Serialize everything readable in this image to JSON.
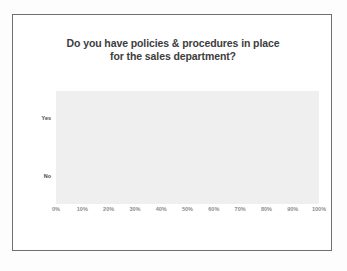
{
  "slide": {
    "title_line_1": "Do you have policies & procedures in place",
    "title_line_2": "for the sales department?",
    "border_color": "#6f6f6f",
    "background_color": "#ffffff"
  },
  "chart_data": {
    "type": "bar",
    "orientation": "horizontal",
    "title": "Do you have policies & procedures in place for the sales department?",
    "categories": [
      "Yes",
      "No"
    ],
    "values": [
      63,
      38
    ],
    "xlabel": "",
    "ylabel": "",
    "xlim": [
      0,
      100
    ],
    "xtick_values": [
      0,
      10,
      20,
      30,
      40,
      50,
      60,
      70,
      80,
      90,
      100
    ],
    "xtick_labels": [
      "0%",
      "10%",
      "20%",
      "30%",
      "40%",
      "50%",
      "60%",
      "70%",
      "80%",
      "90%",
      "100%"
    ],
    "grid": false,
    "legend": false,
    "bar_color": "#a6a6a6",
    "plot_background_color": "#efefef",
    "tick_label_color": "#8d8d8d",
    "category_label_color": "#4a4a4a"
  }
}
